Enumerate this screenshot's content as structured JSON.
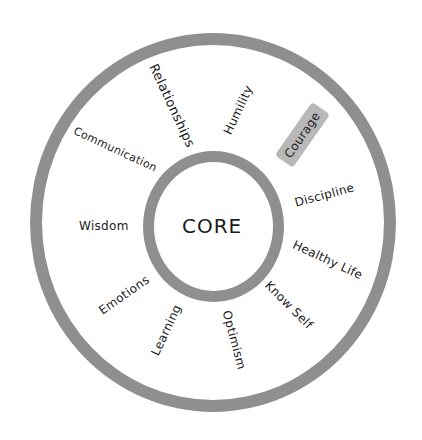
{
  "diagram": {
    "center": {
      "label": "CORE"
    },
    "ring_color": "#8f8f8f",
    "highlight_color": "#b8b8b8",
    "items": [
      {
        "label": "Relationships",
        "highlighted": false
      },
      {
        "label": "Humility",
        "highlighted": false
      },
      {
        "label": "Courage",
        "highlighted": true
      },
      {
        "label": "Discipline",
        "highlighted": false
      },
      {
        "label": "Healthy Life",
        "highlighted": false
      },
      {
        "label": "Know Self",
        "highlighted": false
      },
      {
        "label": "Optimism",
        "highlighted": false
      },
      {
        "label": "Learning",
        "highlighted": false
      },
      {
        "label": "Emotions",
        "highlighted": false
      },
      {
        "label": "Wisdom",
        "highlighted": false
      },
      {
        "label": "Communication",
        "highlighted": false
      }
    ]
  }
}
